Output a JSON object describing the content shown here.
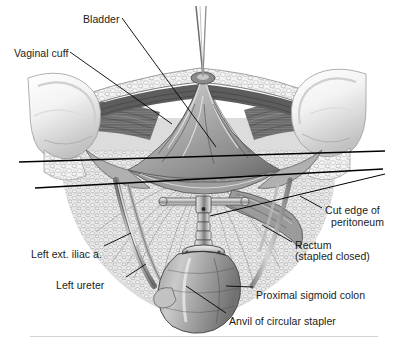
{
  "figure": {
    "background_color": "#ffffff",
    "label_color": "#1b1b1b",
    "leader_color": "#000000",
    "rule_color": "#d3d3d3"
  },
  "labels": [
    {
      "id": "bladder",
      "text": "Bladder",
      "x": 83,
      "y": 14,
      "align": "left"
    },
    {
      "id": "vaginal-cuff",
      "text": "Vaginal cuff",
      "x": 14,
      "y": 48,
      "align": "left"
    },
    {
      "id": "cut-edge-1",
      "text": "Cut edge of",
      "x": 325,
      "y": 205,
      "align": "left"
    },
    {
      "id": "cut-edge-2",
      "text": "peritoneum",
      "x": 331,
      "y": 217,
      "align": "left"
    },
    {
      "id": "rectum-1",
      "text": "Rectum",
      "x": 295,
      "y": 240,
      "align": "left"
    },
    {
      "id": "rectum-2",
      "text": "(stapled closed)",
      "x": 295,
      "y": 251,
      "align": "left"
    },
    {
      "id": "left-ext-iliac",
      "text": "Left ext. iliac a.",
      "x": 31,
      "y": 249,
      "align": "left"
    },
    {
      "id": "left-ureter",
      "text": "Left ureter",
      "x": 56,
      "y": 280,
      "align": "left"
    },
    {
      "id": "proximal-sigmoid",
      "text": "Proximal sigmoid colon",
      "x": 256,
      "y": 290,
      "align": "left"
    },
    {
      "id": "anvil",
      "text": "Anvil of circular stapler",
      "x": 229,
      "y": 316,
      "align": "left"
    }
  ],
  "structures": [
    {
      "id": "suture-thread",
      "name": "suture thread above vaginal cuff apex"
    },
    {
      "id": "fat-band",
      "name": "subcutaneous fat / fatty tissue band"
    },
    {
      "id": "bladder-peritoneum",
      "name": "triangular bladder peritoneal fold"
    },
    {
      "id": "pelvic-sidewall-left",
      "name": "left pelvic sidewall bone"
    },
    {
      "id": "pelvic-sidewall-right",
      "name": "right pelvic sidewall bone"
    },
    {
      "id": "rectal-stump",
      "name": "stapled rectal stump"
    },
    {
      "id": "stapler-anvil",
      "name": "anvil of circular stapler with T handle"
    },
    {
      "id": "sigmoid-colon",
      "name": "proximal sigmoid colon segment"
    },
    {
      "id": "left-iliac-artery",
      "name": "left external iliac artery cord"
    },
    {
      "id": "left-ureter-cord",
      "name": "left ureter cord"
    }
  ],
  "leaders": [
    {
      "id": "leader-bladder",
      "from": [
        122,
        18
      ],
      "to": [
        216,
        147
      ]
    },
    {
      "id": "leader-vaginal",
      "from": [
        70,
        52
      ],
      "to": [
        172,
        124
      ]
    },
    {
      "id": "leader-cut-edge",
      "from": [
        322,
        208
      ],
      "to": [
        300,
        196
      ]
    },
    {
      "id": "leader-rectum",
      "from": [
        292,
        242
      ],
      "to": [
        262,
        225
      ]
    },
    {
      "id": "leader-iliac",
      "from": [
        104,
        246
      ],
      "to": [
        131,
        233
      ]
    },
    {
      "id": "leader-ureter",
      "from": [
        126,
        277
      ],
      "to": [
        146,
        264
      ]
    },
    {
      "id": "leader-sigmoid",
      "from": [
        253,
        287
      ],
      "to": [
        226,
        286
      ]
    },
    {
      "id": "leader-anvil",
      "from": [
        226,
        313
      ],
      "to": [
        186,
        286
      ]
    },
    {
      "id": "leader-long-a",
      "from": [
        19,
        162
      ],
      "to": [
        385,
        151
      ]
    },
    {
      "id": "leader-long-b",
      "from": [
        35,
        188
      ],
      "to": [
        383,
        169
      ]
    },
    {
      "id": "leader-stapler",
      "from": [
        210,
        216
      ],
      "to": [
        385,
        174
      ]
    }
  ]
}
